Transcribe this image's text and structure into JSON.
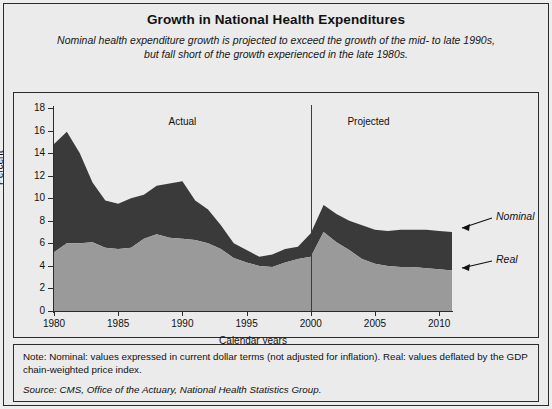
{
  "title": "Growth in National Health Expenditures",
  "subtitle": "Nominal health expenditure growth is projected to exceed the growth of the mid- to late 1990s, but fall short of the growth experienced in the late 1980s.",
  "notes": {
    "note": "Note: Nominal: values expressed in current dollar terms (not adjusted for inflation). Real: values deflated by the GDP chain-weighted price index.",
    "source": "Source: CMS, Office of the Actuary, National Health Statistics Group."
  },
  "annotations": {
    "actual": "Actual",
    "projected": "Projected",
    "nominal": "Nominal",
    "real": "Real"
  },
  "colors": {
    "nominal_band": "#3a3a3a",
    "real_band": "#9a9a9a",
    "background": "#ebebeb",
    "axis": "#2b2b2b"
  },
  "chart_data": {
    "type": "area",
    "title": "Growth in National Health Expenditures",
    "xlabel": "Calendar years",
    "ylabel": "Percent",
    "xlim": [
      1980,
      2011
    ],
    "ylim": [
      0,
      18
    ],
    "ytick_values": [
      0,
      2,
      4,
      6,
      8,
      10,
      12,
      14,
      16,
      18
    ],
    "xtick_values": [
      1980,
      1985,
      1990,
      1995,
      2000,
      2005,
      2010
    ],
    "grid": false,
    "legend_position": "right-annotations",
    "divider_year": 2000,
    "divider_label_left": "Actual",
    "divider_label_right": "Projected",
    "x": [
      1980,
      1981,
      1982,
      1983,
      1984,
      1985,
      1986,
      1987,
      1988,
      1989,
      1990,
      1991,
      1992,
      1993,
      1994,
      1995,
      1996,
      1997,
      1998,
      1999,
      2000,
      2001,
      2002,
      2003,
      2004,
      2005,
      2006,
      2007,
      2008,
      2009,
      2010,
      2011
    ],
    "series": [
      {
        "name": "Nominal",
        "values": [
          14.8,
          15.9,
          14.0,
          11.4,
          9.8,
          9.5,
          10.0,
          10.3,
          11.1,
          11.3,
          11.5,
          9.8,
          9.0,
          7.6,
          6.0,
          5.4,
          4.8,
          5.0,
          5.5,
          5.7,
          6.9,
          9.4,
          8.6,
          8.0,
          7.6,
          7.2,
          7.1,
          7.2,
          7.2,
          7.2,
          7.1,
          7.0
        ]
      },
      {
        "name": "Real",
        "values": [
          5.2,
          6.0,
          6.0,
          6.1,
          5.6,
          5.5,
          5.6,
          6.4,
          6.8,
          6.5,
          6.4,
          6.3,
          6.0,
          5.5,
          4.7,
          4.3,
          4.0,
          3.9,
          4.3,
          4.6,
          4.8,
          7.0,
          6.1,
          5.4,
          4.6,
          4.2,
          4.0,
          3.9,
          3.9,
          3.8,
          3.7,
          3.6
        ]
      }
    ]
  }
}
